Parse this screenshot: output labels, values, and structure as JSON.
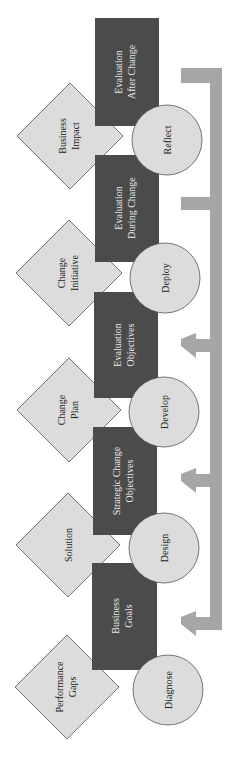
{
  "diagram": {
    "orientation": "rotated-90-ccw",
    "colors": {
      "rect_fill": "#4b4b4b",
      "rect_text": "#e8e8e8",
      "circle_fill": "#dcdcdc",
      "diamond_fill": "#dcdcdc",
      "outline": "#555555",
      "arrow": "#a6a6a6",
      "text_dark": "#222222"
    },
    "phases": [
      {
        "circle": "Diagnose",
        "rect": [
          "Business",
          "Goals"
        ],
        "diamond": [
          "Performance",
          "Gaps"
        ]
      },
      {
        "circle": "Design",
        "rect": [
          "Strategic Change",
          "Objectives"
        ],
        "diamond": [
          "Solution"
        ]
      },
      {
        "circle": "Develop",
        "rect": [
          "Evaluation",
          "Objectives"
        ],
        "diamond": [
          "Change",
          "Plan"
        ]
      },
      {
        "circle": "Deploy",
        "rect": [
          "Evaluation",
          "During Change"
        ],
        "diamond": [
          "Change",
          "Initiative"
        ]
      },
      {
        "circle": "Reflect",
        "rect": [
          "Evaluation",
          "After Change"
        ],
        "diamond": [
          "Business",
          "Impact"
        ]
      }
    ]
  }
}
